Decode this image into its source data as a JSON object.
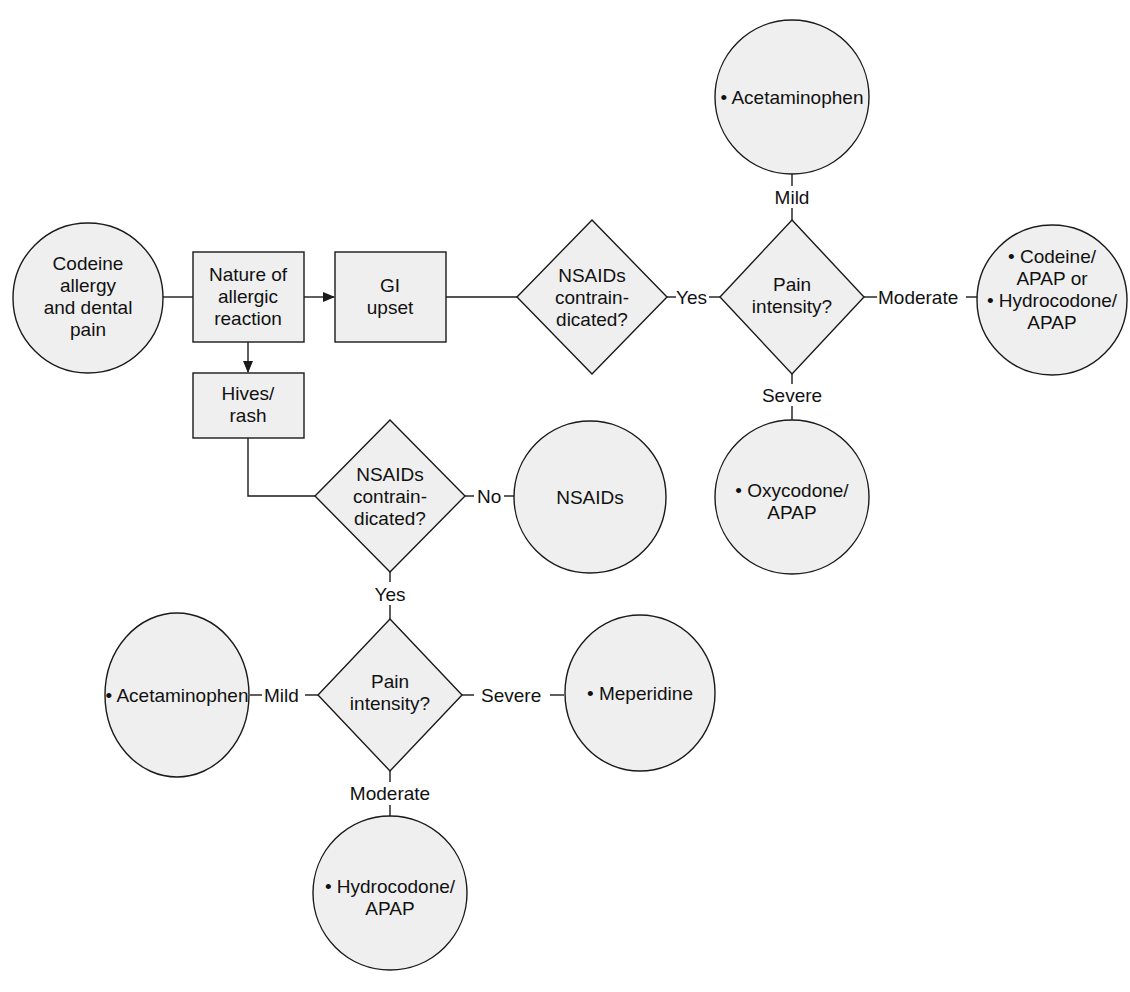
{
  "diagram": {
    "start": {
      "lines": [
        "Codeine",
        "allergy",
        "and dental",
        "pain"
      ]
    },
    "nature_box": {
      "lines": [
        "Nature of",
        "allergic",
        "reaction"
      ]
    },
    "gi_box": {
      "lines": [
        "GI",
        "upset"
      ]
    },
    "hives_box": {
      "lines": [
        "Hives/",
        "rash"
      ]
    },
    "gi_branch": {
      "decision": {
        "lines": [
          "NSAIDs",
          "contrain-",
          "dicated?"
        ]
      },
      "yes_label": "Yes",
      "pain_decision": {
        "lines": [
          "Pain",
          "intensity?"
        ]
      },
      "mild_label": "Mild",
      "moderate_label": "Moderate",
      "severe_label": "Severe",
      "mild_result": {
        "lines": [
          "• Acetaminophen"
        ]
      },
      "moderate_result": {
        "lines": [
          "• Codeine/",
          "APAP or",
          "• Hydrocodone/",
          "APAP"
        ]
      },
      "severe_result": {
        "lines": [
          "• Oxycodone/",
          "APAP"
        ]
      }
    },
    "hives_branch": {
      "decision": {
        "lines": [
          "NSAIDs",
          "contrain-",
          "dicated?"
        ]
      },
      "no_label": "No",
      "no_result": {
        "lines": [
          "NSAIDs"
        ]
      },
      "yes_label": "Yes",
      "pain_decision": {
        "lines": [
          "Pain",
          "intensity?"
        ]
      },
      "mild_label": "Mild",
      "moderate_label": "Moderate",
      "severe_label": "Severe",
      "mild_result": {
        "lines": [
          "• Acetaminophen"
        ]
      },
      "moderate_result": {
        "lines": [
          "• Hydrocodone/",
          "APAP"
        ]
      },
      "severe_result": {
        "lines": [
          "• Meperidine"
        ]
      }
    },
    "colors": {
      "fill": "#efefef",
      "stroke": "#1a1a1a",
      "text": "#111111"
    }
  }
}
